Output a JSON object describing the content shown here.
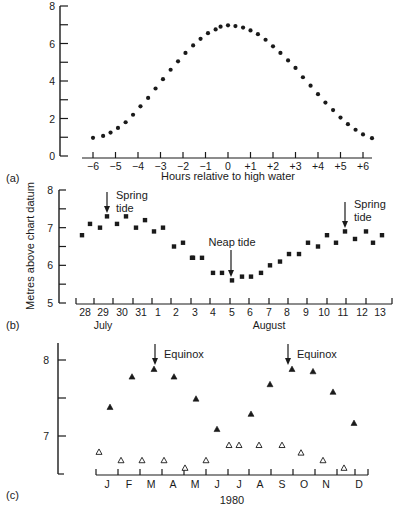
{
  "figure": {
    "panel_labels": [
      "(a)",
      "(b)",
      "(c)"
    ],
    "shared_ylabel": "Metres above chart datum",
    "colors": {
      "ink": "#1a1a1a",
      "background": "#ffffff"
    }
  },
  "chart_data": [
    {
      "id": "a",
      "type": "scatter",
      "panel_label": "(a)",
      "title": "",
      "xlabel": "Hours relative to high water",
      "ylabel": "",
      "xlim": [
        -6.2,
        6.7
      ],
      "ylim": [
        0,
        8
      ],
      "xticks": [
        -6,
        -5,
        -4,
        -3,
        -2,
        -1,
        0,
        1,
        2,
        3,
        4,
        5,
        6
      ],
      "xtick_labels": [
        "−6",
        "−5",
        "−4",
        "−3",
        "−2",
        "−1",
        "0",
        "+1",
        "+2",
        "+3",
        "+4",
        "+5",
        "+6"
      ],
      "yticks": [
        0,
        1,
        2,
        3,
        4,
        5,
        6,
        7,
        8
      ],
      "ytick_labels": [
        "0",
        "",
        "2",
        "",
        "4",
        "",
        "6",
        "",
        "8"
      ],
      "grid": false,
      "marker": "filled-circle",
      "x": [
        -6.0,
        -5.55,
        -5.22,
        -4.89,
        -4.55,
        -4.22,
        -3.89,
        -3.55,
        -3.22,
        -2.89,
        -2.55,
        -2.22,
        -1.89,
        -1.55,
        -1.22,
        -0.89,
        -0.55,
        -0.33,
        0.0,
        0.33,
        0.67,
        1.0,
        1.33,
        1.67,
        2.0,
        2.33,
        2.67,
        3.0,
        3.33,
        3.67,
        4.0,
        4.33,
        4.67,
        5.0,
        5.33,
        5.67,
        6.0,
        6.4
      ],
      "y": [
        0.97,
        1.07,
        1.25,
        1.5,
        1.8,
        2.2,
        2.65,
        3.1,
        3.6,
        4.1,
        4.6,
        5.05,
        5.5,
        5.9,
        6.25,
        6.55,
        6.75,
        6.9,
        6.97,
        6.93,
        6.85,
        6.7,
        6.5,
        6.2,
        5.85,
        5.5,
        5.1,
        4.7,
        4.2,
        3.75,
        3.3,
        2.85,
        2.45,
        2.05,
        1.7,
        1.4,
        1.15,
        0.95
      ]
    },
    {
      "id": "b",
      "type": "scatter",
      "panel_label": "(b)",
      "title": "",
      "xlabel": "",
      "month_labels": [
        {
          "text": "July",
          "at": 29.5
        },
        {
          "text": "August",
          "at": 37.5
        }
      ],
      "ylabel": "Metres above chart datum",
      "xlim": [
        27.4,
        44.0
      ],
      "ylim": [
        5,
        8
      ],
      "xticks": [
        28.5,
        29.5,
        30.5,
        31.5,
        32.5,
        33.5,
        34.5,
        35.5,
        36.5,
        37.5,
        38.5,
        39.5,
        40.5,
        41.5,
        42.5,
        43.5
      ],
      "day_label_positions": [
        28,
        29,
        30,
        31,
        32,
        33,
        34,
        35,
        36,
        37,
        38,
        39,
        40,
        41,
        42,
        43
      ],
      "day_labels": [
        "28",
        "29",
        "30",
        "31",
        "1",
        "2",
        "3",
        "4",
        "5",
        "6",
        "7",
        "8",
        "9",
        "10",
        "11",
        "12",
        "13"
      ],
      "yticks": [
        5,
        5.5,
        6,
        6.5,
        7,
        7.5,
        8
      ],
      "ytick_labels": [
        "5",
        "",
        "6",
        "",
        "7",
        "",
        "8"
      ],
      "grid": false,
      "marker": "filled-square",
      "x": [
        27.8,
        28.25,
        28.75,
        29.0,
        29.5,
        30.0,
        30.5,
        31.0,
        31.5,
        32.0,
        32.5,
        33.0,
        33.5,
        33.95,
        34.5,
        35.0,
        35.45,
        36.0,
        36.5,
        37.0,
        37.5,
        38.0,
        38.5,
        39.0,
        39.5,
        40.0,
        40.5,
        41.0,
        41.5,
        42.0,
        42.5,
        43.0,
        43.45
      ],
      "y": [
        6.8,
        7.1,
        7.0,
        7.3,
        7.1,
        7.3,
        7.0,
        7.2,
        6.9,
        7.0,
        6.5,
        6.6,
        6.2,
        6.2,
        6.2,
        5.8,
        5.8,
        5.6,
        5.7,
        5.7,
        5.8,
        6.0,
        6.1,
        6.3,
        6.3,
        6.6,
        6.5,
        6.8,
        6.6,
        6.9,
        6.7,
        6.9,
        6.6,
        6.8
      ],
      "annotations": [
        {
          "text": "Spring tide",
          "lines": [
            "Spring",
            "tide"
          ],
          "arrow_x": 29.0,
          "arrow_top": 7.9,
          "arrow_tip": 7.4
        },
        {
          "text": "Neap tide",
          "lines": [
            "Neap tide"
          ],
          "arrow_x": 35.95,
          "arrow_top": 6.3,
          "arrow_tip": 5.65
        },
        {
          "text": "Spring tide",
          "lines": [
            "Spring",
            "tide"
          ],
          "arrow_x": 41.0,
          "arrow_top": 7.8,
          "arrow_tip": 7.0
        }
      ]
    },
    {
      "id": "c",
      "type": "scatter",
      "panel_label": "(c)",
      "title": "",
      "xlabel": "1980",
      "ylabel": "",
      "xlim": [
        0,
        12.4
      ],
      "ylim": [
        6.5,
        8.25
      ],
      "xticks": [
        0,
        1,
        2,
        3,
        4,
        5,
        6,
        7,
        8,
        9,
        10,
        11,
        12
      ],
      "month_labels": [
        "J",
        "F",
        "M",
        "A",
        "M",
        "J",
        "J",
        "A",
        "S",
        "O",
        "N",
        "D"
      ],
      "yticks": [
        7,
        7.5,
        8
      ],
      "ytick_labels": [
        "7",
        "",
        "8"
      ],
      "grid": false,
      "series": [
        {
          "name": "Spring tide high water",
          "marker": "filled-triangle",
          "x": [
            0.65,
            1.65,
            2.65,
            3.55,
            4.55,
            5.5,
            7.05,
            7.9,
            8.9,
            9.85,
            10.8,
            11.75
          ],
          "y": [
            7.38,
            7.78,
            7.88,
            7.78,
            7.49,
            7.09,
            7.29,
            7.68,
            7.88,
            7.85,
            7.58,
            7.17
          ]
        },
        {
          "name": "Neap tide high water",
          "marker": "open-triangle",
          "x": [
            0.15,
            1.15,
            2.1,
            3.1,
            4.05,
            5.05,
            6.05,
            6.5,
            7.45,
            8.5,
            9.35,
            10.35,
            11.3
          ],
          "y": [
            6.79,
            6.68,
            6.68,
            6.68,
            6.58,
            6.68,
            6.88,
            6.88,
            6.88,
            6.88,
            6.78,
            6.68,
            6.58
          ]
        }
      ],
      "annotations": [
        {
          "text": "Equinox",
          "arrow_x": 2.65,
          "arrow_top": 8.3,
          "arrow_tip": 7.98
        },
        {
          "text": "Equinox",
          "arrow_x": 8.8,
          "arrow_top": 8.3,
          "arrow_tip": 7.98
        }
      ]
    }
  ]
}
